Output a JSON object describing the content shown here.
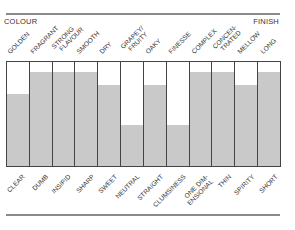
{
  "header": {
    "left_label": "COLOUR",
    "right_label": "FINISH"
  },
  "chart_data": {
    "type": "bar",
    "title": "",
    "xlabel": "",
    "ylabel": "",
    "ylim": [
      0,
      1
    ],
    "grid": false,
    "categories": [
      "GOLDEN",
      "FRAGRANT",
      "STRONG FLAVOUR",
      "SMOOTH",
      "DRY",
      "GRAPEY/ FRUITY",
      "OAKY",
      "FINESSE",
      "COMPLEX",
      "CONCEN- TRATED",
      "MELLOW",
      "LONG"
    ],
    "opposite_categories": [
      "CLEAR",
      "DUMB",
      "INSIPID",
      "SHARP",
      "SWEET",
      "NEUTRAL",
      "STRAIGHT",
      "CLUMSINESS",
      "ONE DIM- ENSIONAL",
      "THIN",
      "SPIRITY",
      "SHORT"
    ],
    "values": [
      0.69,
      0.9,
      0.9,
      0.9,
      0.78,
      0.39,
      0.78,
      0.39,
      0.9,
      0.9,
      0.78,
      0.9
    ],
    "colors": {
      "fill": "#c9c9c9",
      "border": "#444444",
      "empty": "#ffffff"
    }
  },
  "columns": [
    {
      "top": "GOLDEN",
      "top2": "",
      "bottom": "CLEAR",
      "bottom2": "",
      "value": 0.69
    },
    {
      "top": "FRAGRANT",
      "top2": "",
      "bottom": "DUMB",
      "bottom2": "",
      "value": 0.9
    },
    {
      "top": "STRONG",
      "top2": "FLAVOUR",
      "bottom": "INSIPID",
      "bottom2": "",
      "value": 0.9
    },
    {
      "top": "SMOOTH",
      "top2": "",
      "bottom": "SHARP",
      "bottom2": "",
      "value": 0.9
    },
    {
      "top": "DRY",
      "top2": "",
      "bottom": "SWEET",
      "bottom2": "",
      "value": 0.78
    },
    {
      "top": "GRAPEY/",
      "top2": "FRUITY",
      "bottom": "NEUTRAL",
      "bottom2": "",
      "value": 0.39
    },
    {
      "top": "OAKY",
      "top2": "",
      "bottom": "STRAIGHT",
      "bottom2": "",
      "value": 0.78
    },
    {
      "top": "FINESSE",
      "top2": "",
      "bottom": "CLUMSINESS",
      "bottom2": "",
      "value": 0.39
    },
    {
      "top": "COMPLEX",
      "top2": "",
      "bottom": "ONE DIM-",
      "bottom2": "ENSIONAL",
      "value": 0.9
    },
    {
      "top": "CONCEN-",
      "top2": "TRATED",
      "bottom": "THIN",
      "bottom2": "",
      "value": 0.9
    },
    {
      "top": "MELLOW",
      "top2": "",
      "bottom": "SPIRITY",
      "bottom2": "",
      "value": 0.78
    },
    {
      "top": "LONG",
      "top2": "",
      "bottom": "SHORT",
      "bottom2": "",
      "value": 0.9
    }
  ]
}
